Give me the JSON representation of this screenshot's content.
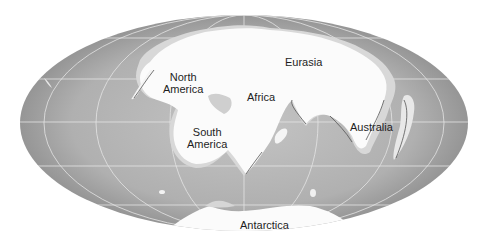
{
  "map": {
    "projection": "mollweide-style oval",
    "colors": {
      "ocean_center": "#bdbdbd",
      "ocean_edge": "#8f8f8f",
      "land": "#fbfbfb",
      "shelf": "#d9d9d9",
      "grid": "#e6e6e6",
      "background": "#ffffff"
    },
    "labels": [
      {
        "id": "north-america",
        "line1": "North",
        "line2": "America"
      },
      {
        "id": "eurasia",
        "line1": "Eurasia"
      },
      {
        "id": "africa",
        "line1": "Africa"
      },
      {
        "id": "south-america",
        "line1": "South",
        "line2": "America"
      },
      {
        "id": "australia",
        "line1": "Australia"
      },
      {
        "id": "antarctica",
        "line1": "Antarctica"
      }
    ]
  }
}
